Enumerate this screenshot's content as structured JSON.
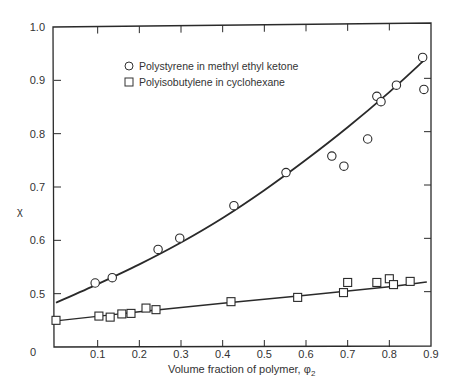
{
  "chart_data": {
    "type": "scatter",
    "title": "",
    "xlabel": "Volume fraction of polymer, φ₂",
    "xlabel_main": "Volume fraction of polymer, ",
    "xlabel_symbol": "φ",
    "xlabel_sub": "2",
    "ylabel": "χ",
    "xlim": [
      0,
      0.9
    ],
    "ylim": [
      0.4,
      1.0
    ],
    "x_ticks": [
      0,
      0.1,
      0.2,
      0.3,
      0.4,
      0.5,
      0.6,
      0.7,
      0.8,
      0.9
    ],
    "x_tick_labels": [
      "0",
      "0.1",
      "0.2",
      "0.3",
      "0.4",
      "0.5",
      "0.6",
      "0.7",
      "0.8",
      "0.9"
    ],
    "y_ticks": [
      0.5,
      0.6,
      0.7,
      0.8,
      0.9,
      1.0
    ],
    "y_tick_labels": [
      "0.5",
      "0.6",
      "0.7",
      "0.8",
      "0.9",
      "1.0"
    ],
    "origin_label": "0",
    "grid": false,
    "legend_position": "upper-left-inside",
    "series": [
      {
        "name": "Polystyrene in methyl ethyl ketone",
        "marker": "circle",
        "points": [
          [
            0.094,
            0.52
          ],
          [
            0.135,
            0.53
          ],
          [
            0.245,
            0.583
          ],
          [
            0.297,
            0.604
          ],
          [
            0.427,
            0.665
          ],
          [
            0.552,
            0.727
          ],
          [
            0.662,
            0.758
          ],
          [
            0.691,
            0.739
          ],
          [
            0.748,
            0.79
          ],
          [
            0.77,
            0.87
          ],
          [
            0.78,
            0.86
          ],
          [
            0.817,
            0.891
          ],
          [
            0.88,
            0.943
          ],
          [
            0.883,
            0.883
          ]
        ],
        "fit_curve": [
          [
            0.0,
            0.483
          ],
          [
            0.1,
            0.518
          ],
          [
            0.2,
            0.555
          ],
          [
            0.3,
            0.596
          ],
          [
            0.4,
            0.642
          ],
          [
            0.5,
            0.694
          ],
          [
            0.6,
            0.751
          ],
          [
            0.7,
            0.812
          ],
          [
            0.8,
            0.878
          ],
          [
            0.88,
            0.935
          ]
        ]
      },
      {
        "name": "Polyisobutylene in cyclohexane",
        "marker": "square",
        "points": [
          [
            0.0,
            0.45
          ],
          [
            0.103,
            0.458
          ],
          [
            0.13,
            0.456
          ],
          [
            0.158,
            0.462
          ],
          [
            0.18,
            0.463
          ],
          [
            0.216,
            0.473
          ],
          [
            0.24,
            0.47
          ],
          [
            0.42,
            0.485
          ],
          [
            0.58,
            0.493
          ],
          [
            0.69,
            0.502
          ],
          [
            0.7,
            0.521
          ],
          [
            0.77,
            0.521
          ],
          [
            0.8,
            0.528
          ],
          [
            0.81,
            0.517
          ],
          [
            0.85,
            0.523
          ]
        ],
        "fit_curve": [
          [
            0.0,
            0.449
          ],
          [
            0.2,
            0.466
          ],
          [
            0.4,
            0.482
          ],
          [
            0.6,
            0.497
          ],
          [
            0.8,
            0.513
          ],
          [
            0.89,
            0.522
          ]
        ]
      }
    ]
  }
}
